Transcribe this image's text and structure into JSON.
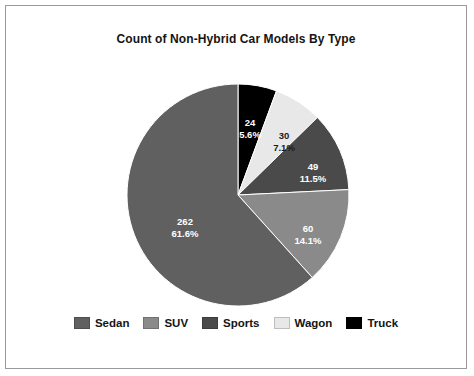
{
  "chart_data": {
    "type": "pie",
    "title": "Count of Non-Hybrid Car Models By Type",
    "xlabel": "",
    "ylabel": "",
    "legend_position": "bottom",
    "grid": false,
    "total": 425,
    "start_angle_deg": 0,
    "direction": "clockwise",
    "categories": [
      "Sedan",
      "SUV",
      "Sports",
      "Wagon",
      "Truck"
    ],
    "values": [
      262,
      49,
      60,
      30,
      24
    ],
    "percents": [
      "61.6%",
      "11.5%",
      "14.1%",
      "7.1%",
      "5.6%"
    ],
    "colors": [
      "#606060",
      "#4a4a4a",
      "#8a8a8a",
      "#e8e8e8",
      "#000000"
    ],
    "slices": [
      {
        "label": "Truck",
        "value": 24,
        "value_text": "24",
        "percent_text": "5.6%",
        "percent": 5.6,
        "color": "#000000",
        "label_fill": "on-dark",
        "start_deg": 0,
        "end_deg": 20.3,
        "label_x": 128,
        "label_y": 42
      },
      {
        "label": "Wagon",
        "value": 30,
        "value_text": "30",
        "percent_text": "7.1%",
        "percent": 7.1,
        "color": "#e8e8e8",
        "label_fill": "on-light",
        "start_deg": 20.3,
        "end_deg": 45.7,
        "label_x": 162,
        "label_y": 55
      },
      {
        "label": "SUV",
        "value": 49,
        "value_text": "49",
        "percent_text": "11.5%",
        "percent": 11.5,
        "color": "#4a4a4a",
        "label_fill": "on-dark",
        "start_deg": 45.7,
        "end_deg": 87.2,
        "label_x": 191,
        "label_y": 86
      },
      {
        "label": "Sports",
        "value": 60,
        "value_text": "60",
        "percent_text": "14.1%",
        "percent": 14.1,
        "color": "#8a8a8a",
        "label_fill": "on-dark",
        "start_deg": 87.2,
        "end_deg": 138.0,
        "label_x": 186,
        "label_y": 148
      },
      {
        "label": "Sedan",
        "value": 262,
        "value_text": "262",
        "percent_text": "61.6%",
        "percent": 61.6,
        "color": "#606060",
        "label_fill": "on-dark",
        "start_deg": 138.0,
        "end_deg": 360.0,
        "label_x": 63,
        "label_y": 141
      }
    ]
  },
  "legend": {
    "items": [
      {
        "label": "Sedan",
        "color": "#606060"
      },
      {
        "label": "SUV",
        "color": "#8a8a8a"
      },
      {
        "label": "Sports",
        "color": "#4a4a4a"
      },
      {
        "label": "Wagon",
        "color": "#e8e8e8"
      },
      {
        "label": "Truck",
        "color": "#000000"
      }
    ]
  }
}
